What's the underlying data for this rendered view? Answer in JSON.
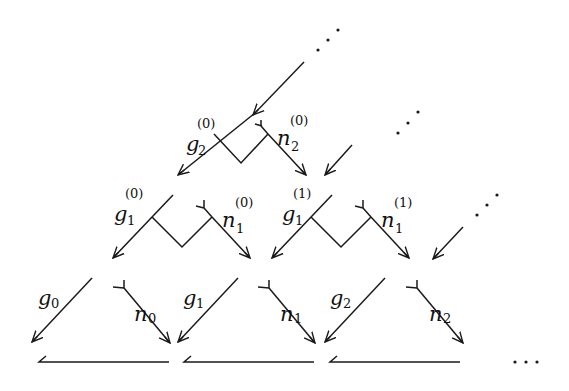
{
  "diagram": {
    "type": "pyramid-of-arrows",
    "stroke_color": "#1a1a1a",
    "background": "#ffffff",
    "rows": [
      {
        "level": 2,
        "nodes": [
          {
            "g_label": {
              "base": "g",
              "sub": "2",
              "sup": "(0)"
            },
            "n_label": {
              "base": "n",
              "sub": "2",
              "sup": "(0)"
            }
          }
        ]
      },
      {
        "level": 1,
        "nodes": [
          {
            "g_label": {
              "base": "g",
              "sub": "1",
              "sup": "(0)"
            },
            "n_label": {
              "base": "n",
              "sub": "1",
              "sup": "(0)"
            }
          },
          {
            "g_label": {
              "base": "g",
              "sub": "1",
              "sup": "(1)"
            },
            "n_label": {
              "base": "n",
              "sub": "1",
              "sup": "(1)"
            }
          }
        ]
      },
      {
        "level": 0,
        "nodes": [
          {
            "g_label": {
              "base": "g",
              "sub": "0"
            },
            "n_label": {
              "base": "n",
              "sub": "0"
            }
          },
          {
            "g_label": {
              "base": "g",
              "sub": "1"
            },
            "n_label": {
              "base": "n",
              "sub": "1"
            }
          },
          {
            "g_label": {
              "base": "g",
              "sub": "2"
            },
            "n_label": {
              "base": "n",
              "sub": "2"
            }
          }
        ]
      }
    ],
    "continuation": {
      "diagonal_dots": "⋰",
      "trailing_dots": "···"
    }
  }
}
